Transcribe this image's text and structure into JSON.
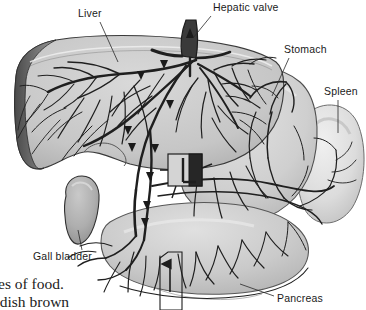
{
  "figure": {
    "name": "liver-digestive-anatomy-illustration",
    "style": "halftone grayscale textbook engraving",
    "background_color": "#ffffff",
    "ink_color": "#1d1d1d"
  },
  "labels": [
    {
      "id": "liver",
      "text": "Liver",
      "x": 78,
      "y": 8,
      "leader": {
        "x1": 100,
        "y1": 22,
        "x2": 118,
        "y2": 62
      }
    },
    {
      "id": "hepatic-valve",
      "text": "Hepatic valve",
      "x": 213,
      "y": 2,
      "leader": {
        "x1": 211,
        "y1": 16,
        "x2": 193,
        "y2": 38
      }
    },
    {
      "id": "stomach",
      "text": "Stomach",
      "x": 284,
      "y": 44,
      "leader": {
        "x1": 289,
        "y1": 58,
        "x2": 272,
        "y2": 96
      }
    },
    {
      "id": "spleen",
      "text": "Spleen",
      "x": 324,
      "y": 86,
      "leader": {
        "x1": 338,
        "y1": 100,
        "x2": 338,
        "y2": 133
      }
    },
    {
      "id": "gall-bladder",
      "text": "Gall bladder",
      "x": 33,
      "y": 251,
      "leader": {
        "x1": 82,
        "y1": 250,
        "x2": 78,
        "y2": 230
      }
    },
    {
      "id": "pancreas",
      "text": "Pancreas",
      "x": 277,
      "y": 293,
      "leader": {
        "x1": 274,
        "y1": 296,
        "x2": 240,
        "y2": 284
      }
    }
  ],
  "organs": [
    {
      "id": "liver",
      "label": "Liver",
      "fill": "#cfcfcf",
      "edge": "#2a2a2a"
    },
    {
      "id": "gall-bladder",
      "label": "Gall bladder",
      "fill": "#b4b4b4",
      "edge": "#2a2a2a"
    },
    {
      "id": "stomach",
      "label": "Stomach",
      "fill": "#d8d8d8",
      "edge": "#333333"
    },
    {
      "id": "spleen",
      "label": "Spleen",
      "fill": "#e4e4e4",
      "edge": "#3a3a3a"
    },
    {
      "id": "pancreas",
      "label": "Pancreas",
      "fill": "#d2d2d2",
      "edge": "#333333"
    },
    {
      "id": "duodenum",
      "label": "Duodenum",
      "fill": "#cccccc",
      "edge": "#333333"
    }
  ],
  "callout_box": {
    "id": "detail-box",
    "x": 160,
    "y": 252,
    "width": 22,
    "height": 58,
    "arrow_direction": "up"
  },
  "valve_inset": {
    "id": "hepatic-valve-inset",
    "x": 168,
    "y": 154,
    "width": 34,
    "height": 32
  },
  "flow_arrows": [
    {
      "id": "hepatic-vein-arrow",
      "x": 190,
      "y": 34,
      "direction": "up"
    },
    {
      "id": "portal-arrow-1",
      "x": 141,
      "y": 75,
      "direction": "left"
    },
    {
      "id": "portal-arrow-2",
      "x": 128,
      "y": 130,
      "direction": "left"
    },
    {
      "id": "portal-arrow-3",
      "x": 132,
      "y": 147,
      "direction": "left"
    },
    {
      "id": "portal-arrow-4",
      "x": 155,
      "y": 148,
      "direction": "up"
    },
    {
      "id": "portal-arrow-5",
      "x": 150,
      "y": 176,
      "direction": "up"
    },
    {
      "id": "portal-arrow-6",
      "x": 147,
      "y": 205,
      "direction": "up"
    },
    {
      "id": "portal-arrow-7",
      "x": 145,
      "y": 222,
      "direction": "up"
    },
    {
      "id": "detail-box-arrow",
      "x": 170,
      "y": 268,
      "direction": "up"
    }
  ],
  "caption": {
    "lines": [
      "ses of food.",
      "ddish brown"
    ]
  }
}
